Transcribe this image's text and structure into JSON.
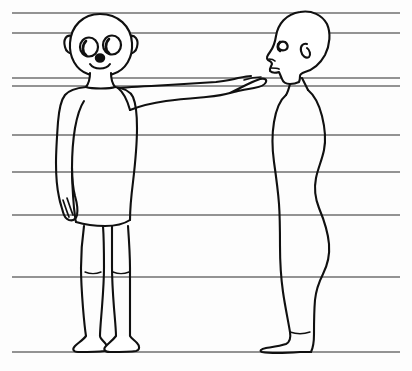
{
  "document": {
    "title": "Two figures with horizontal reference lines",
    "type": "line-drawing",
    "width": 412,
    "height": 371,
    "background_color": "#fdfdfd",
    "ink_color": "#101010",
    "rule_color": "#6f6f6f"
  },
  "guides": {
    "name": "horizontal-reference-lines",
    "count": 9,
    "x_start": 12,
    "x_end": 400,
    "stroke_width": 1.6,
    "color": "#6f6f6f",
    "y_positions": [
      13,
      33,
      78,
      86,
      135,
      172,
      215,
      277,
      352
    ]
  },
  "figures": [
    {
      "id": "front-figure",
      "label": "Front-facing child figure with outstretched arm",
      "orientation": "front",
      "x_center": 103,
      "head_top": 14,
      "feet_bottom": 352,
      "parts": [
        "head",
        "left-ear",
        "right-ear",
        "left-eye",
        "right-eye",
        "nose",
        "mouth",
        "neck",
        "torso",
        "left-arm-down",
        "left-hand",
        "right-arm-extended",
        "right-hand-pointing",
        "left-leg",
        "right-leg",
        "left-foot",
        "right-foot"
      ]
    },
    {
      "id": "profile-figure",
      "label": "Side-profile figure facing left",
      "orientation": "profile-left",
      "x_center": 308,
      "head_top": 12,
      "feet_bottom": 352,
      "parts": [
        "head-profile",
        "eye",
        "ear",
        "nose",
        "lips",
        "chin",
        "neck",
        "chest",
        "back",
        "buttocks",
        "leg",
        "foot"
      ]
    }
  ],
  "annotations": {
    "visible_text": []
  }
}
